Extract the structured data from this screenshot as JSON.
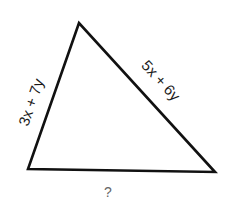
{
  "figure": {
    "type": "triangle",
    "vertices": {
      "top": [
        79,
        23
      ],
      "bottom_left": [
        28,
        169
      ],
      "bottom_right": [
        215,
        172
      ]
    },
    "stroke_color": "#111111",
    "side_labels": {
      "left": "3x + 7y",
      "right": "5x + 6y",
      "bottom": "?"
    }
  }
}
